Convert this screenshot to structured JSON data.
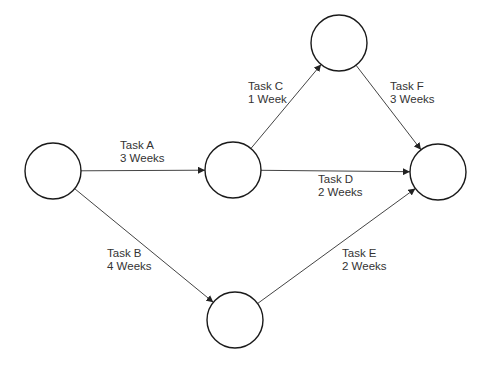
{
  "diagram": {
    "type": "network-activity-on-arrow",
    "colors": {
      "node_stroke": "#1a1a1a",
      "edge_stroke": "#444444",
      "text": "#333333",
      "background": "#ffffff"
    },
    "nodes": [
      {
        "id": "n1",
        "cx": 53,
        "cy": 171,
        "r": 28
      },
      {
        "id": "n2",
        "cx": 233,
        "cy": 170,
        "r": 28
      },
      {
        "id": "n3",
        "cx": 339,
        "cy": 43,
        "r": 28
      },
      {
        "id": "n4",
        "cx": 438,
        "cy": 172,
        "r": 28
      },
      {
        "id": "n5",
        "cx": 235,
        "cy": 320,
        "r": 28
      }
    ],
    "edges": [
      {
        "id": "task-a",
        "from": "n1",
        "to": "n2",
        "task": "Task A",
        "duration": "3 Weeks",
        "label_x": 120,
        "label_y": 139
      },
      {
        "id": "task-b",
        "from": "n1",
        "to": "n5",
        "task": "Task B",
        "duration": "4 Weeks",
        "label_x": 107,
        "label_y": 247
      },
      {
        "id": "task-c",
        "from": "n2",
        "to": "n3",
        "task": "Task C",
        "duration": "1 Week",
        "label_x": 248,
        "label_y": 80
      },
      {
        "id": "task-d",
        "from": "n2",
        "to": "n4",
        "task": "Task D",
        "duration": "2 Weeks",
        "label_x": 318,
        "label_y": 173
      },
      {
        "id": "task-e",
        "from": "n5",
        "to": "n4",
        "task": "Task E",
        "duration": "2 Weeks",
        "label_x": 342,
        "label_y": 247
      },
      {
        "id": "task-f",
        "from": "n3",
        "to": "n4",
        "task": "Task F",
        "duration": "3 Weeks",
        "label_x": 390,
        "label_y": 80
      }
    ]
  }
}
